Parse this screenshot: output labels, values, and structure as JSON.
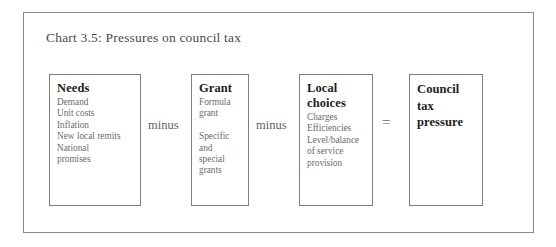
{
  "chart_data": {
    "type": "diagram",
    "title": "Chart 3.5: Pressures on council tax",
    "layout": "horizontal equation flow",
    "nodes": [
      {
        "heading": "Needs",
        "lines": [
          "Demand",
          "Unit costs",
          "Inflation",
          "New local remits",
          "National",
          "promises"
        ]
      },
      {
        "heading": "Grant",
        "lines": [
          "Formula",
          "grant",
          "",
          "Specific",
          "and",
          "special",
          "grants"
        ]
      },
      {
        "heading": "Local choices",
        "lines": [
          "Charges",
          "Efficiencies",
          "Level/balance",
          "of service",
          "provision"
        ]
      },
      {
        "heading": "Council tax pressure",
        "lines": []
      }
    ],
    "operators": [
      "minus",
      "minus",
      "="
    ],
    "equation": "Needs minus Grant minus Local choices = Council tax pressure"
  },
  "figure": {
    "title": "Chart 3.5: Pressures on council tax",
    "boxes": {
      "needs": {
        "heading": "Needs",
        "lines": [
          "Demand",
          "Unit costs",
          "Inflation",
          "New local remits",
          "National",
          "promises"
        ]
      },
      "grant": {
        "heading": "Grant",
        "lines": [
          "Formula",
          "grant",
          "",
          "Specific",
          "and",
          "special",
          "grants"
        ]
      },
      "local": {
        "heading_line_1": "Local",
        "heading_line_2": "choices",
        "lines": [
          "Charges",
          "Efficiencies",
          "Level/balance",
          "of service",
          "provision"
        ]
      },
      "result": {
        "heading_line_1": "Council",
        "heading_line_2": "tax",
        "heading_line_3": "pressure"
      }
    },
    "operators": {
      "minus_1": "minus",
      "minus_2": "minus",
      "equals": "="
    },
    "colors": {
      "frame": "#8a8a8a",
      "box_border": "#7d7d7d",
      "heading_text": "#1d1d1d",
      "detail_text": "#6b6b6b",
      "title_text": "#4a4a4a"
    }
  }
}
